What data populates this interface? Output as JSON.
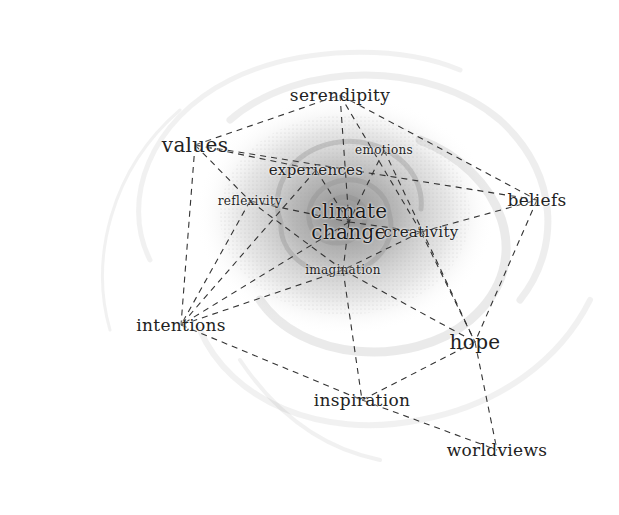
{
  "diagram": {
    "title": "",
    "center": {
      "id": "climate_change",
      "lines": [
        "climate",
        "change"
      ],
      "x": 349,
      "y": 222
    },
    "nodes": [
      {
        "id": "serendipity",
        "label": "serendipity",
        "x": 340,
        "y": 95,
        "size": "lg"
      },
      {
        "id": "values",
        "label": "values",
        "x": 195,
        "y": 145,
        "size": "xl"
      },
      {
        "id": "emotions",
        "label": "emotions",
        "x": 384,
        "y": 150,
        "size": "sm"
      },
      {
        "id": "experiences",
        "label": "experiences",
        "x": 316,
        "y": 170,
        "size": "md"
      },
      {
        "id": "reflexivity",
        "label": "reflexivity",
        "x": 250,
        "y": 201,
        "size": "sm"
      },
      {
        "id": "creativity",
        "label": "creativity",
        "x": 421,
        "y": 232,
        "size": "md"
      },
      {
        "id": "beliefs",
        "label": "beliefs",
        "x": 537,
        "y": 200,
        "size": "lg"
      },
      {
        "id": "imagination",
        "label": "imagination",
        "x": 343,
        "y": 270,
        "size": "sm"
      },
      {
        "id": "intentions",
        "label": "intentions",
        "x": 181,
        "y": 325,
        "size": "lg"
      },
      {
        "id": "hope",
        "label": "hope",
        "x": 475,
        "y": 342,
        "size": "xl"
      },
      {
        "id": "inspiration",
        "label": "inspiration",
        "x": 362,
        "y": 400,
        "size": "lg"
      },
      {
        "id": "worldviews",
        "label": "worldviews",
        "x": 497,
        "y": 450,
        "size": "lg"
      }
    ],
    "edges": [
      [
        "values",
        "serendipity"
      ],
      [
        "values",
        "experiences"
      ],
      [
        "values",
        "beliefs"
      ],
      [
        "values",
        "intentions"
      ],
      [
        "values",
        "reflexivity"
      ],
      [
        "serendipity",
        "climate_change"
      ],
      [
        "serendipity",
        "creativity"
      ],
      [
        "serendipity",
        "beliefs"
      ],
      [
        "emotions",
        "climate_change"
      ],
      [
        "emotions",
        "hope"
      ],
      [
        "experiences",
        "climate_change"
      ],
      [
        "experiences",
        "intentions"
      ],
      [
        "reflexivity",
        "climate_change"
      ],
      [
        "reflexivity",
        "intentions"
      ],
      [
        "reflexivity",
        "imagination"
      ],
      [
        "climate_change",
        "creativity"
      ],
      [
        "climate_change",
        "imagination"
      ],
      [
        "climate_change",
        "intentions"
      ],
      [
        "creativity",
        "beliefs"
      ],
      [
        "creativity",
        "hope"
      ],
      [
        "creativity",
        "imagination"
      ],
      [
        "imagination",
        "intentions"
      ],
      [
        "imagination",
        "hope"
      ],
      [
        "imagination",
        "inspiration"
      ],
      [
        "beliefs",
        "hope"
      ],
      [
        "intentions",
        "inspiration"
      ],
      [
        "hope",
        "inspiration"
      ],
      [
        "hope",
        "worldviews"
      ],
      [
        "inspiration",
        "worldviews"
      ]
    ],
    "colors": {
      "text": "#222222",
      "edge": "#333333",
      "swirl_dark": "#6e6e6e",
      "swirl_light": "#d9d9d9",
      "background": "#ffffff"
    }
  }
}
